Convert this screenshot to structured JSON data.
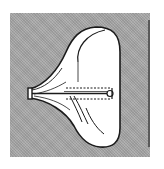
{
  "figure": {
    "colors": {
      "background": "#a8a8a8",
      "sac_fill": "#ffffff",
      "outline": "#1a1a1a",
      "page": "#ffffff"
    },
    "elements": [
      {
        "name": "gray-square-background"
      },
      {
        "name": "sac-body"
      },
      {
        "name": "inner-fold-upper"
      },
      {
        "name": "inner-fold-lower"
      },
      {
        "name": "neck-opening"
      },
      {
        "name": "dashed-tube"
      },
      {
        "name": "tube-end-cap"
      }
    ]
  }
}
